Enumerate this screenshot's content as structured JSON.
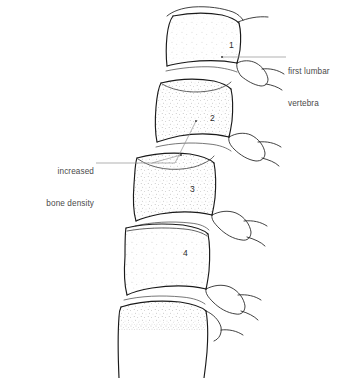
{
  "figure": {
    "background_color": "#ffffff",
    "line_color": "#1a1a1a",
    "stipple_color": "#6b6b6b",
    "label_color": "#4a4a4a",
    "leader_color": "#8a8a8a"
  },
  "annotations": [
    {
      "id": "first-lumbar-vertebra",
      "line1": "first lumbar",
      "line2": "vertebra",
      "position": "right",
      "leader": "horizontal line from vertebra 1 body to label"
    },
    {
      "id": "increased-bone-density",
      "line1": "increased",
      "line2": "bone density",
      "position": "left",
      "leader": "horizontal line branching to vertebra 2 and vertebra 3 bodies"
    }
  ],
  "vertebrae": [
    {
      "number": "1",
      "label_x": 229,
      "label_y": 45
    },
    {
      "number": "2",
      "label_x": 210,
      "label_y": 118
    },
    {
      "number": "3",
      "label_x": 190,
      "label_y": 189
    },
    {
      "number": "4",
      "label_x": 183,
      "label_y": 253
    },
    {
      "number": "",
      "label_x": 0,
      "label_y": 0
    }
  ],
  "icons": {
    "vertebra_body": "vertebral-body-shape",
    "spinous_process": "spinous-process-shape",
    "stipple": "bone-density-stipple-texture"
  }
}
